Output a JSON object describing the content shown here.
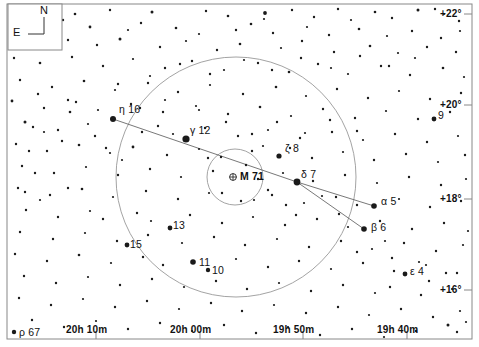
{
  "chart_data": {
    "type": "scatter",
    "xlabel": "Right Ascension",
    "ylabel": "Declination",
    "grid": false,
    "legend_position": "none",
    "projection": "equatorial",
    "xlim": [
      "20h 15m",
      "19h 35m"
    ],
    "ylim": [
      "+15deg",
      "+23deg"
    ],
    "ra_ticks": [
      {
        "label": "20h 10m",
        "x": 96
      },
      {
        "label": "20h 00m",
        "x": 200
      },
      {
        "label": "19h 50m",
        "x": 303
      },
      {
        "label": "19h 40m",
        "x": 407
      }
    ],
    "dec_ticks": [
      {
        "label": "+22°",
        "y": 14
      },
      {
        "label": "+20°",
        "y": 105
      },
      {
        "label": "+18°",
        "y": 199
      },
      {
        "label": "+16°",
        "y": 290
      }
    ],
    "labeled_stars": [
      {
        "label": "η 16",
        "x": 113,
        "y": 119,
        "mag_r": 3.0,
        "lx": 119,
        "ly": 104
      },
      {
        "label": "γ 12",
        "x": 186,
        "y": 139,
        "mag_r": 3.6,
        "lx": 190,
        "ly": 125
      },
      {
        "label": "ζ 8",
        "x": 279,
        "y": 156,
        "mag_r": 2.6,
        "lx": 285,
        "ly": 143
      },
      {
        "label": "δ 7",
        "x": 297,
        "y": 182,
        "mag_r": 3.4,
        "lx": 301,
        "ly": 169
      },
      {
        "label": "α 5",
        "x": 374,
        "y": 206,
        "mag_r": 2.8,
        "lx": 381,
        "ly": 196
      },
      {
        "label": "β 6",
        "x": 364,
        "y": 229,
        "mag_r": 2.8,
        "lx": 371,
        "ly": 222
      },
      {
        "label": "ε 4",
        "x": 405,
        "y": 274,
        "mag_r": 2.4,
        "lx": 410,
        "ly": 266
      },
      {
        "label": "9",
        "x": 434,
        "y": 119,
        "mag_r": 2.4,
        "lx": 438,
        "ly": 110
      },
      {
        "label": "13",
        "x": 170,
        "y": 228,
        "mag_r": 2.4,
        "lx": 173,
        "ly": 220
      },
      {
        "label": "15",
        "x": 127,
        "y": 245,
        "mag_r": 2.4,
        "lx": 130,
        "ly": 239
      },
      {
        "label": "11",
        "x": 193,
        "y": 262,
        "mag_r": 2.8,
        "lx": 199,
        "ly": 257
      },
      {
        "label": "10",
        "x": 208,
        "y": 270,
        "mag_r": 2.2,
        "lx": 212,
        "ly": 265
      },
      {
        "label": "ρ 67",
        "x": 14,
        "y": 332,
        "mag_r": 2.2,
        "lx": 19,
        "ly": 327
      }
    ],
    "deep_sky_objects": [
      {
        "label": "M 71",
        "type": "globular-cluster",
        "x": 233,
        "y": 177,
        "r": 3.4,
        "lx": 240,
        "ly": 171
      }
    ],
    "constellation_lines": [
      {
        "from": [
          113,
          119
        ],
        "to": [
          297,
          182
        ]
      },
      {
        "from": [
          297,
          182
        ],
        "to": [
          374,
          206
        ]
      },
      {
        "from": [
          297,
          182
        ],
        "to": [
          364,
          229
        ]
      }
    ],
    "circles": [
      {
        "name": "constellation-boundary-outer",
        "cx": 236,
        "cy": 177,
        "r": 120
      },
      {
        "name": "constellation-boundary-inner",
        "cx": 235,
        "cy": 177,
        "r": 28
      }
    ],
    "field_stars": [
      [
        75,
        14,
        1.3
      ],
      [
        110,
        10,
        1.2
      ],
      [
        152,
        12,
        1.5
      ],
      [
        206,
        11,
        1.2
      ],
      [
        228,
        16,
        1.3
      ],
      [
        265,
        13,
        1.9
      ],
      [
        264,
        19,
        1.1
      ],
      [
        292,
        10,
        1.2
      ],
      [
        314,
        17,
        1.2
      ],
      [
        338,
        9,
        1.2
      ],
      [
        351,
        20,
        1.1
      ],
      [
        375,
        12,
        1.3
      ],
      [
        392,
        18,
        1.2
      ],
      [
        418,
        10,
        1.5
      ],
      [
        435,
        9,
        1.2
      ],
      [
        444,
        14,
        1.1
      ],
      [
        459,
        21,
        1.2
      ],
      [
        63,
        20,
        1.2
      ],
      [
        90,
        27,
        1.4
      ],
      [
        128,
        30,
        1.1
      ],
      [
        141,
        23,
        1.2
      ],
      [
        176,
        28,
        1.3
      ],
      [
        199,
        34,
        1.1
      ],
      [
        236,
        30,
        1.2
      ],
      [
        251,
        24,
        1.3
      ],
      [
        273,
        33,
        1.2
      ],
      [
        307,
        27,
        1.1
      ],
      [
        329,
        35,
        1.2
      ],
      [
        359,
        29,
        1.3
      ],
      [
        387,
        36,
        1.1
      ],
      [
        412,
        31,
        1.2
      ],
      [
        441,
        38,
        1.2
      ],
      [
        460,
        31,
        1.1
      ],
      [
        68,
        40,
        1.2
      ],
      [
        97,
        45,
        1.2
      ],
      [
        120,
        39,
        1.5
      ],
      [
        160,
        47,
        1.2
      ],
      [
        186,
        41,
        1.1
      ],
      [
        217,
        50,
        1.2
      ],
      [
        240,
        44,
        1.3
      ],
      [
        281,
        48,
        1.1
      ],
      [
        302,
        41,
        1.2
      ],
      [
        334,
        52,
        1.2
      ],
      [
        370,
        46,
        1.3
      ],
      [
        398,
        53,
        1.1
      ],
      [
        427,
        47,
        1.2
      ],
      [
        456,
        52,
        1.2
      ],
      [
        14,
        58,
        1.2
      ],
      [
        40,
        63,
        1.3
      ],
      [
        72,
        57,
        1.2
      ],
      [
        103,
        66,
        1.2
      ],
      [
        133,
        59,
        1.1
      ],
      [
        165,
        68,
        1.2
      ],
      [
        192,
        61,
        1.2
      ],
      [
        224,
        70,
        1.1
      ],
      [
        258,
        63,
        1.2
      ],
      [
        289,
        72,
        1.3
      ],
      [
        318,
        64,
        1.2
      ],
      [
        348,
        74,
        1.1
      ],
      [
        381,
        66,
        1.2
      ],
      [
        410,
        75,
        1.2
      ],
      [
        443,
        68,
        1.3
      ],
      [
        464,
        77,
        1.1
      ],
      [
        20,
        80,
        1.2
      ],
      [
        52,
        87,
        1.2
      ],
      [
        84,
        81,
        1.3
      ],
      [
        115,
        90,
        1.1
      ],
      [
        148,
        83,
        1.2
      ],
      [
        178,
        92,
        1.2
      ],
      [
        210,
        85,
        1.1
      ],
      [
        243,
        94,
        1.2
      ],
      [
        276,
        87,
        1.3
      ],
      [
        306,
        96,
        1.1
      ],
      [
        337,
        89,
        1.2
      ],
      [
        368,
        98,
        1.2
      ],
      [
        399,
        91,
        1.1
      ],
      [
        430,
        99,
        1.2
      ],
      [
        461,
        93,
        1.2
      ],
      [
        12,
        101,
        1.4
      ],
      [
        44,
        108,
        1.2
      ],
      [
        76,
        102,
        1.2
      ],
      [
        98,
        110,
        1.1
      ],
      [
        131,
        104,
        1.2
      ],
      [
        163,
        112,
        1.2
      ],
      [
        196,
        106,
        1.1
      ],
      [
        228,
        114,
        1.2
      ],
      [
        260,
        107,
        1.3
      ],
      [
        291,
        116,
        1.1
      ],
      [
        323,
        109,
        1.2
      ],
      [
        355,
        118,
        1.2
      ],
      [
        386,
        111,
        1.1
      ],
      [
        418,
        119,
        1.2
      ],
      [
        450,
        112,
        1.2
      ],
      [
        25,
        122,
        1.5
      ],
      [
        33,
        127,
        1.2
      ],
      [
        58,
        130,
        1.2
      ],
      [
        88,
        124,
        1.1
      ],
      [
        142,
        132,
        1.2
      ],
      [
        158,
        126,
        1.2
      ],
      [
        173,
        134,
        1.1
      ],
      [
        205,
        128,
        1.2
      ],
      [
        238,
        136,
        1.2
      ],
      [
        268,
        130,
        1.1
      ],
      [
        300,
        138,
        1.2
      ],
      [
        332,
        132,
        1.2
      ],
      [
        363,
        140,
        1.1
      ],
      [
        395,
        134,
        1.2
      ],
      [
        427,
        142,
        1.2
      ],
      [
        458,
        136,
        1.1
      ],
      [
        16,
        144,
        1.2
      ],
      [
        47,
        151,
        1.2
      ],
      [
        79,
        145,
        1.3
      ],
      [
        110,
        153,
        1.1
      ],
      [
        133,
        147,
        1.4
      ],
      [
        167,
        155,
        1.2
      ],
      [
        199,
        149,
        1.1
      ],
      [
        221,
        157,
        1.2
      ],
      [
        252,
        151,
        1.2
      ],
      [
        263,
        146,
        1.1
      ],
      [
        290,
        148,
        1.2
      ],
      [
        312,
        158,
        1.2
      ],
      [
        343,
        152,
        1.1
      ],
      [
        374,
        160,
        1.2
      ],
      [
        406,
        154,
        1.2
      ],
      [
        438,
        162,
        1.1
      ],
      [
        465,
        155,
        1.2
      ],
      [
        22,
        166,
        1.2
      ],
      [
        54,
        173,
        1.2
      ],
      [
        86,
        167,
        1.1
      ],
      [
        118,
        175,
        1.2
      ],
      [
        150,
        169,
        1.2
      ],
      [
        181,
        177,
        1.1
      ],
      [
        213,
        171,
        1.2
      ],
      [
        258,
        179,
        1.2
      ],
      [
        283,
        173,
        1.1
      ],
      [
        313,
        181,
        1.2
      ],
      [
        345,
        175,
        1.2
      ],
      [
        377,
        183,
        1.1
      ],
      [
        409,
        177,
        1.2
      ],
      [
        441,
        185,
        1.2
      ],
      [
        466,
        179,
        1.1
      ],
      [
        18,
        188,
        1.2
      ],
      [
        50,
        195,
        1.2
      ],
      [
        82,
        189,
        1.3
      ],
      [
        113,
        197,
        1.1
      ],
      [
        146,
        191,
        1.2
      ],
      [
        178,
        199,
        1.2
      ],
      [
        209,
        193,
        1.1
      ],
      [
        241,
        201,
        1.2
      ],
      [
        272,
        195,
        1.2
      ],
      [
        304,
        203,
        1.1
      ],
      [
        336,
        197,
        1.2
      ],
      [
        357,
        205,
        1.2
      ],
      [
        399,
        199,
        1.1
      ],
      [
        430,
        207,
        1.2
      ],
      [
        461,
        201,
        1.2
      ],
      [
        26,
        210,
        1.2
      ],
      [
        58,
        217,
        1.2
      ],
      [
        90,
        211,
        1.1
      ],
      [
        103,
        219,
        1.2
      ],
      [
        137,
        213,
        1.2
      ],
      [
        151,
        221,
        1.1
      ],
      [
        190,
        215,
        1.2
      ],
      [
        222,
        223,
        1.2
      ],
      [
        253,
        217,
        1.1
      ],
      [
        285,
        225,
        1.2
      ],
      [
        317,
        219,
        1.2
      ],
      [
        348,
        227,
        1.1
      ],
      [
        380,
        221,
        1.2
      ],
      [
        412,
        229,
        1.2
      ],
      [
        444,
        223,
        1.2
      ],
      [
        468,
        231,
        1.1
      ],
      [
        20,
        232,
        1.2
      ],
      [
        53,
        239,
        1.2
      ],
      [
        85,
        233,
        1.1
      ],
      [
        117,
        241,
        1.2
      ],
      [
        148,
        235,
        1.2
      ],
      [
        182,
        243,
        1.1
      ],
      [
        214,
        237,
        1.2
      ],
      [
        245,
        245,
        1.2
      ],
      [
        277,
        239,
        1.1
      ],
      [
        309,
        247,
        1.2
      ],
      [
        341,
        241,
        1.2
      ],
      [
        372,
        249,
        1.1
      ],
      [
        404,
        243,
        1.2
      ],
      [
        436,
        251,
        1.2
      ],
      [
        463,
        245,
        1.1
      ],
      [
        15,
        254,
        1.2
      ],
      [
        47,
        261,
        1.2
      ],
      [
        79,
        255,
        1.3
      ],
      [
        111,
        263,
        1.1
      ],
      [
        143,
        257,
        1.2
      ],
      [
        163,
        265,
        1.2
      ],
      [
        236,
        259,
        1.1
      ],
      [
        268,
        267,
        1.2
      ],
      [
        299,
        261,
        1.2
      ],
      [
        331,
        269,
        1.1
      ],
      [
        363,
        263,
        1.2
      ],
      [
        394,
        271,
        1.2
      ],
      [
        426,
        265,
        1.1
      ],
      [
        457,
        273,
        1.2
      ],
      [
        24,
        276,
        1.2
      ],
      [
        56,
        283,
        1.2
      ],
      [
        88,
        277,
        1.1
      ],
      [
        120,
        285,
        1.2
      ],
      [
        152,
        279,
        1.2
      ],
      [
        184,
        287,
        1.1
      ],
      [
        216,
        281,
        1.2
      ],
      [
        247,
        289,
        1.2
      ],
      [
        279,
        283,
        1.1
      ],
      [
        311,
        291,
        1.2
      ],
      [
        343,
        285,
        1.2
      ],
      [
        375,
        293,
        1.1
      ],
      [
        390,
        287,
        1.2
      ],
      [
        421,
        295,
        1.2
      ],
      [
        452,
        289,
        1.1
      ],
      [
        19,
        298,
        1.2
      ],
      [
        51,
        305,
        1.2
      ],
      [
        83,
        299,
        1.1
      ],
      [
        115,
        307,
        1.2
      ],
      [
        147,
        301,
        1.2
      ],
      [
        179,
        309,
        1.1
      ],
      [
        211,
        303,
        1.2
      ],
      [
        242,
        311,
        1.2
      ],
      [
        274,
        305,
        1.1
      ],
      [
        306,
        313,
        1.2
      ],
      [
        338,
        307,
        1.2
      ],
      [
        369,
        315,
        1.1
      ],
      [
        401,
        309,
        1.2
      ],
      [
        433,
        317,
        1.2
      ],
      [
        460,
        311,
        1.1
      ],
      [
        32,
        320,
        1.2
      ],
      [
        64,
        327,
        1.2
      ],
      [
        96,
        321,
        1.1
      ],
      [
        128,
        329,
        1.2
      ],
      [
        160,
        323,
        1.2
      ],
      [
        192,
        331,
        1.1
      ],
      [
        224,
        325,
        1.2
      ],
      [
        256,
        333,
        1.2
      ],
      [
        288,
        327,
        1.1
      ],
      [
        320,
        335,
        1.2
      ],
      [
        352,
        329,
        1.2
      ],
      [
        384,
        337,
        1.1
      ],
      [
        416,
        331,
        1.2
      ],
      [
        448,
        325,
        1.5
      ],
      [
        457,
        332,
        1.2
      ],
      [
        466,
        322,
        1.1
      ],
      [
        68,
        100,
        1.2
      ],
      [
        70,
        112,
        1.3
      ],
      [
        38,
        94,
        1.2
      ],
      [
        95,
        136,
        1.2
      ],
      [
        106,
        148,
        1.2
      ],
      [
        122,
        160,
        1.1
      ],
      [
        62,
        141,
        1.2
      ],
      [
        44,
        132,
        1.1
      ],
      [
        29,
        151,
        1.2
      ],
      [
        35,
        173,
        1.2
      ],
      [
        68,
        188,
        1.2
      ],
      [
        40,
        200,
        1.1
      ],
      [
        25,
        192,
        1.2
      ],
      [
        246,
        165,
        1.2
      ],
      [
        222,
        193,
        1.2
      ],
      [
        254,
        200,
        1.1
      ],
      [
        208,
        158,
        1.2
      ],
      [
        268,
        190,
        1.2
      ],
      [
        286,
        205,
        1.2
      ],
      [
        322,
        196,
        1.1
      ],
      [
        296,
        215,
        1.2
      ],
      [
        339,
        214,
        1.2
      ],
      [
        385,
        241,
        1.1
      ],
      [
        357,
        252,
        1.2
      ],
      [
        392,
        258,
        1.2
      ],
      [
        419,
        262,
        1.1
      ],
      [
        429,
        281,
        1.2
      ],
      [
        446,
        273,
        1.2
      ],
      [
        226,
        122,
        1.2
      ],
      [
        199,
        110,
        1.1
      ],
      [
        252,
        134,
        1.2
      ],
      [
        277,
        122,
        1.2
      ],
      [
        305,
        133,
        1.1
      ],
      [
        330,
        120,
        1.2
      ],
      [
        357,
        131,
        1.2
      ],
      [
        165,
        100,
        1.1
      ],
      [
        140,
        108,
        1.2
      ],
      [
        118,
        84,
        1.2
      ],
      [
        150,
        76,
        1.1
      ],
      [
        180,
        64,
        1.2
      ],
      [
        210,
        74,
        1.2
      ],
      [
        244,
        60,
        1.1
      ],
      [
        272,
        70,
        1.2
      ],
      [
        301,
        58,
        1.2
      ],
      [
        331,
        68,
        1.1
      ],
      [
        360,
        56,
        1.2
      ],
      [
        389,
        66,
        1.2
      ],
      [
        415,
        58,
        1.1
      ]
    ]
  },
  "compass": {
    "north_label": "N",
    "east_label": "E"
  },
  "frame": {
    "border_color": "#888888",
    "star_color": "#1a1a1a",
    "line_color": "#555555",
    "circle_color": "#999999"
  }
}
